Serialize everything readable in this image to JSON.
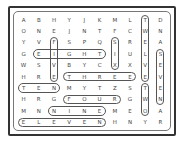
{
  "puzzle": {
    "type": "word-search",
    "rows": 10,
    "cols": 10,
    "grid": [
      [
        "A",
        "B",
        "H",
        "Y",
        "J",
        "K",
        "M",
        "L",
        "T",
        "D"
      ],
      [
        "O",
        "N",
        "E",
        "J",
        "N",
        "T",
        "F",
        "C",
        "W",
        "N"
      ],
      [
        "Y",
        "V",
        "F",
        "S",
        "P",
        "Q",
        "S",
        "R",
        "E",
        "A"
      ],
      [
        "G",
        "E",
        "I",
        "G",
        "H",
        "T",
        "I",
        "U",
        "L",
        "S"
      ],
      [
        "W",
        "S",
        "V",
        "B",
        "Y",
        "C",
        "X",
        "X",
        "V",
        "E"
      ],
      [
        "H",
        "R",
        "E",
        "T",
        "H",
        "R",
        "E",
        "E",
        "E",
        "V"
      ],
      [
        "T",
        "E",
        "N",
        "M",
        "Y",
        "T",
        "Z",
        "S",
        "T",
        "E"
      ],
      [
        "H",
        "R",
        "G",
        "F",
        "O",
        "U",
        "R",
        "G",
        "W",
        "N"
      ],
      [
        "M",
        "N",
        "N",
        "I",
        "N",
        "E",
        "M",
        "E",
        "O",
        "A"
      ],
      [
        "E",
        "L",
        "E",
        "V",
        "E",
        "N",
        "H",
        "N",
        "Y",
        "R"
      ]
    ],
    "found_words": [
      {
        "word": "FIVE",
        "r": 2,
        "c": 2,
        "dir": "v",
        "len": 4
      },
      {
        "word": "EIGHT",
        "r": 3,
        "c": 1,
        "dir": "h",
        "len": 5
      },
      {
        "word": "SIX",
        "r": 2,
        "c": 6,
        "dir": "v",
        "len": 3
      },
      {
        "word": "TWELVE",
        "r": 0,
        "c": 8,
        "dir": "v",
        "len": 6
      },
      {
        "word": "SEVEN",
        "r": 3,
        "c": 9,
        "dir": "v",
        "len": 5
      },
      {
        "word": "THREE",
        "r": 5,
        "c": 3,
        "dir": "h",
        "len": 5
      },
      {
        "word": "TEN",
        "r": 6,
        "c": 0,
        "dir": "h",
        "len": 3
      },
      {
        "word": "TWO",
        "r": 6,
        "c": 8,
        "dir": "v",
        "len": 3
      },
      {
        "word": "FOUR",
        "r": 7,
        "c": 3,
        "dir": "h",
        "len": 4
      },
      {
        "word": "NINE",
        "r": 8,
        "c": 2,
        "dir": "h",
        "len": 4
      },
      {
        "word": "ELEVEN",
        "r": 9,
        "c": 0,
        "dir": "h",
        "len": 6
      }
    ]
  }
}
